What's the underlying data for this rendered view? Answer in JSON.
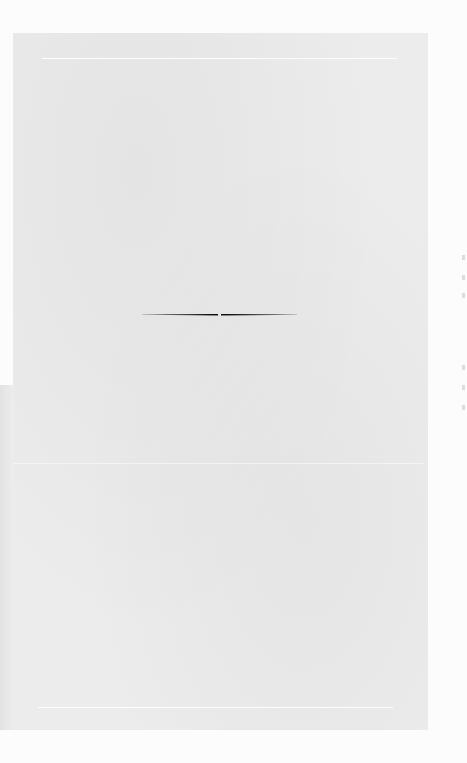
{
  "document": {
    "type": "scanned-book-page",
    "text_content": "",
    "ornament": "horizontal-tapered-rule"
  },
  "colors": {
    "paper": "#ececec",
    "margin": "#fcfcfc",
    "rule": "#111111"
  }
}
